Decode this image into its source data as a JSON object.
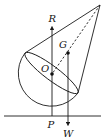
{
  "figure": {
    "labels": {
      "R": "R",
      "G": "G",
      "O": "O",
      "P": "P",
      "W": "W"
    },
    "colors": {
      "ink": "#1a1a1a",
      "background": "#ffffff"
    }
  }
}
